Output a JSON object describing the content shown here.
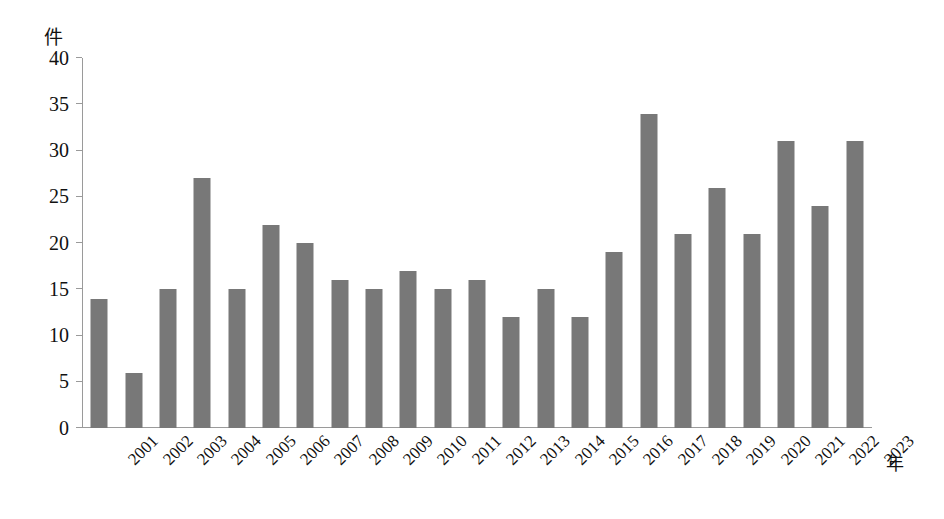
{
  "chart_data": {
    "type": "bar",
    "title": "",
    "xlabel": "年",
    "ylabel": "件",
    "ylim": [
      0,
      40
    ],
    "ytick_step": 5,
    "yticks": [
      40,
      35,
      30,
      25,
      20,
      15,
      10,
      5,
      0
    ],
    "grid": false,
    "legend": null,
    "bar_color": "#787878",
    "axis_color": "#9a9a9a",
    "categories": [
      "2001",
      "2002",
      "2003",
      "2004",
      "2005",
      "2006",
      "2007",
      "2008",
      "2009",
      "2010",
      "2011",
      "2012",
      "2013",
      "2014",
      "2015",
      "2016",
      "2017",
      "2018",
      "2019",
      "2020",
      "2021",
      "2022",
      "2023"
    ],
    "values": [
      14,
      6,
      15,
      27,
      15,
      22,
      20,
      16,
      15,
      17,
      15,
      16,
      12,
      15,
      12,
      19,
      34,
      21,
      26,
      21,
      31,
      24,
      31
    ]
  }
}
